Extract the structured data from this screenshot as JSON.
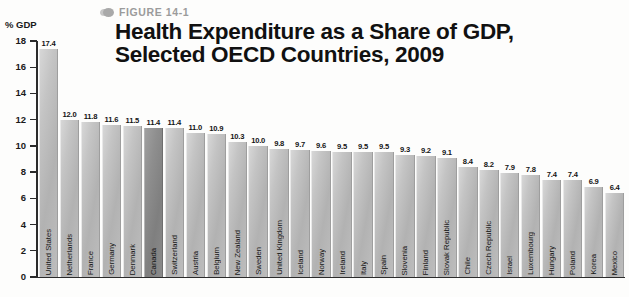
{
  "figure": {
    "marker_icon": "figure-bullet-icon",
    "label": "FIGURE 14-1"
  },
  "title": {
    "line1": "Health Expenditure as a Share of GDP,",
    "line2": "Selected OECD Countries, 2009"
  },
  "axis": {
    "unit_label": "% GDP",
    "y_ticks": [
      "18",
      "16",
      "14",
      "12",
      "10",
      "8",
      "6",
      "4",
      "2",
      "0"
    ]
  },
  "colors": {
    "bar": "#b8b8b8",
    "bar_highlight": "#868686",
    "axis": "#2b2b2b",
    "figure_label": "#9b9b9b",
    "title": "#111111"
  },
  "chart_data": {
    "type": "bar",
    "title": "Health Expenditure as a Share of GDP, Selected OECD Countries, 2009",
    "xlabel": "",
    "ylabel": "% GDP",
    "ylim": [
      0,
      18
    ],
    "ytick_step": 2,
    "grid": false,
    "legend": "none",
    "highlighted_category": "Canada",
    "categories": [
      "United States",
      "Netherlands",
      "France",
      "Germany",
      "Denmark",
      "Canada",
      "Switzerland",
      "Austria",
      "Belgium",
      "New Zealand",
      "Sweden",
      "United Kingdom",
      "Iceland",
      "Norway",
      "Ireland",
      "Italy",
      "Spain",
      "Slovenia",
      "Finland",
      "Slovak Republic",
      "Chile",
      "Czech Republic",
      "Israel",
      "Luxembourg",
      "Hungary",
      "Poland",
      "Korea",
      "Mexico"
    ],
    "values": [
      17.4,
      12.0,
      11.8,
      11.6,
      11.5,
      11.4,
      11.4,
      11.0,
      10.9,
      10.3,
      10.0,
      9.8,
      9.7,
      9.6,
      9.5,
      9.5,
      9.5,
      9.3,
      9.2,
      9.1,
      8.4,
      8.2,
      7.9,
      7.8,
      7.4,
      7.4,
      6.9,
      6.4
    ],
    "value_labels": [
      "17.4",
      "12.0",
      "11.8",
      "11.6",
      "11.5",
      "11.4",
      "11.4",
      "11.0",
      "10.9",
      "10.3",
      "10.0",
      "9.8",
      "9.7",
      "9.6",
      "9.5",
      "9.5",
      "9.5",
      "9.3",
      "9.2",
      "9.1",
      "8.4",
      "8.2",
      "7.9",
      "7.8",
      "7.4",
      "7.4",
      "6.9",
      "6.4"
    ]
  }
}
